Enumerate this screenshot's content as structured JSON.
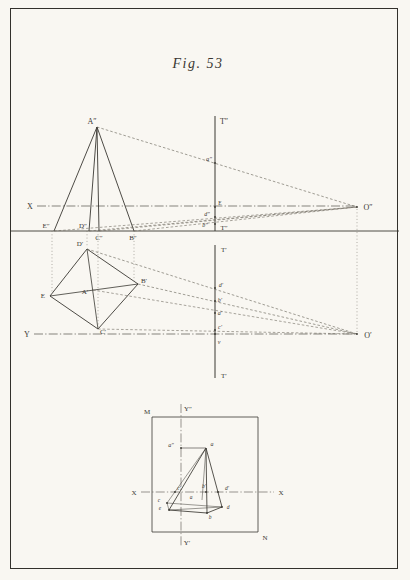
{
  "title": "Fig. 53",
  "colors": {
    "paper": "#f9f7f2",
    "ink": "#3a3832",
    "border": "#33312c",
    "dashed_ray": "#6e6a60",
    "dotted_projector": "#7d7970",
    "axis_dashdot": "#55524a"
  },
  "diagram": {
    "labels": [
      {
        "t": "A″",
        "x": 92,
        "y": 124,
        "fs": 8
      },
      {
        "t": "X",
        "x": 30,
        "y": 209,
        "fs": 8
      },
      {
        "t": "E″",
        "x": 46,
        "y": 228,
        "fs": 7
      },
      {
        "t": "D″",
        "x": 83,
        "y": 228,
        "fs": 7
      },
      {
        "t": "C″",
        "x": 99,
        "y": 240,
        "fs": 7
      },
      {
        "t": "B″",
        "x": 133,
        "y": 240,
        "fs": 7
      },
      {
        "t": "T″",
        "x": 224,
        "y": 124,
        "fs": 8
      },
      {
        "t": "a″",
        "x": 209,
        "y": 161,
        "fs": 6.5,
        "it": true
      },
      {
        "t": "E",
        "x": 220,
        "y": 205,
        "fs": 5.5
      },
      {
        "t": "d″",
        "x": 207,
        "y": 216,
        "fs": 6,
        "it": true
      },
      {
        "t": "b″",
        "x": 205,
        "y": 227,
        "fs": 6,
        "it": true
      },
      {
        "t": "T″",
        "x": 224,
        "y": 230,
        "fs": 7
      },
      {
        "t": "O″",
        "x": 368,
        "y": 210,
        "fs": 8
      },
      {
        "t": "T′",
        "x": 224,
        "y": 252,
        "fs": 7
      },
      {
        "t": "D′",
        "x": 80,
        "y": 246,
        "fs": 7
      },
      {
        "t": "E",
        "x": 43,
        "y": 298,
        "fs": 7
      },
      {
        "t": "A′",
        "x": 85,
        "y": 294,
        "fs": 7
      },
      {
        "t": "B′",
        "x": 144,
        "y": 283,
        "fs": 7
      },
      {
        "t": "C′",
        "x": 103,
        "y": 334,
        "fs": 7
      },
      {
        "t": "Y",
        "x": 27,
        "y": 337,
        "fs": 8
      },
      {
        "t": "d′",
        "x": 221,
        "y": 287,
        "fs": 6,
        "it": true
      },
      {
        "t": "b′",
        "x": 220,
        "y": 302,
        "fs": 6,
        "it": true
      },
      {
        "t": "a′",
        "x": 220,
        "y": 315,
        "fs": 6,
        "it": true
      },
      {
        "t": "c′",
        "x": 220,
        "y": 329,
        "fs": 6,
        "it": true
      },
      {
        "t": "v",
        "x": 219,
        "y": 344,
        "fs": 6,
        "it": true
      },
      {
        "t": "T′",
        "x": 224,
        "y": 378,
        "fs": 7
      },
      {
        "t": "O′",
        "x": 368,
        "y": 338,
        "fs": 8
      },
      {
        "t": "M",
        "x": 147,
        "y": 414,
        "fs": 7
      },
      {
        "t": "Y″",
        "x": 188,
        "y": 411,
        "fs": 7
      },
      {
        "t": "X",
        "x": 134,
        "y": 495,
        "fs": 7
      },
      {
        "t": "X",
        "x": 281,
        "y": 495,
        "fs": 7
      },
      {
        "t": "a″",
        "x": 171,
        "y": 447,
        "fs": 6,
        "it": true
      },
      {
        "t": "a",
        "x": 212,
        "y": 446,
        "fs": 6,
        "it": true
      },
      {
        "t": "c′",
        "x": 179,
        "y": 490,
        "fs": 5.5,
        "it": true
      },
      {
        "t": "b′",
        "x": 204,
        "y": 488,
        "fs": 5.5,
        "it": true
      },
      {
        "t": "d′",
        "x": 227,
        "y": 490,
        "fs": 5.5,
        "it": true
      },
      {
        "t": "a",
        "x": 191,
        "y": 499,
        "fs": 5.5,
        "it": true
      },
      {
        "t": "c",
        "x": 159,
        "y": 502,
        "fs": 5.5,
        "it": true
      },
      {
        "t": "e",
        "x": 160,
        "y": 510,
        "fs": 5.5,
        "it": true
      },
      {
        "t": "b",
        "x": 210,
        "y": 519,
        "fs": 5.5,
        "it": true
      },
      {
        "t": "d",
        "x": 228,
        "y": 509,
        "fs": 5.5,
        "it": true
      },
      {
        "t": "N",
        "x": 265,
        "y": 540,
        "fs": 7
      },
      {
        "t": "Y′",
        "x": 187,
        "y": 545,
        "fs": 7
      }
    ],
    "lines": [
      {
        "s": "so",
        "w": 0.9,
        "p": [
          11,
          231,
          399,
          231
        ]
      },
      {
        "s": "so",
        "w": 1.0,
        "p": [
          215,
          116,
          215,
          231
        ]
      },
      {
        "s": "so",
        "w": 1.0,
        "p": [
          215,
          245,
          215,
          378
        ]
      },
      {
        "s": "dd",
        "w": 0.7,
        "p": [
          37,
          206,
          357,
          206
        ]
      },
      {
        "s": "dd",
        "w": 0.7,
        "p": [
          34,
          334,
          357,
          334
        ]
      },
      {
        "s": "so",
        "w": 0.9,
        "p": [
          97,
          127,
          54,
          231
        ]
      },
      {
        "s": "so",
        "w": 0.9,
        "p": [
          97,
          127,
          89,
          231
        ]
      },
      {
        "s": "so",
        "w": 0.9,
        "p": [
          97,
          127,
          99,
          231
        ]
      },
      {
        "s": "so",
        "w": 0.9,
        "p": [
          97,
          127,
          134,
          231
        ]
      },
      {
        "s": "da",
        "w": 0.65,
        "p": [
          97,
          127,
          357,
          207
        ]
      },
      {
        "s": "da",
        "w": 0.6,
        "p": [
          54,
          231,
          357,
          207
        ]
      },
      {
        "s": "da",
        "w": 0.6,
        "p": [
          89,
          231,
          357,
          207
        ]
      },
      {
        "s": "da",
        "w": 0.6,
        "p": [
          99,
          231,
          357,
          207
        ]
      },
      {
        "s": "da",
        "w": 0.6,
        "p": [
          134,
          231,
          357,
          207
        ]
      },
      {
        "s": "so",
        "w": 0.9,
        "p": [
          87,
          249,
          50,
          296
        ]
      },
      {
        "s": "so",
        "w": 0.9,
        "p": [
          50,
          296,
          98,
          329
        ]
      },
      {
        "s": "so",
        "w": 0.9,
        "p": [
          98,
          329,
          138,
          284
        ]
      },
      {
        "s": "so",
        "w": 0.9,
        "p": [
          138,
          284,
          87,
          249
        ]
      },
      {
        "s": "so",
        "w": 0.8,
        "p": [
          50,
          296,
          138,
          284
        ]
      },
      {
        "s": "so",
        "w": 0.8,
        "p": [
          87,
          249,
          98,
          329
        ]
      },
      {
        "s": "da",
        "w": 0.65,
        "p": [
          87,
          249,
          357,
          334
        ]
      },
      {
        "s": "da",
        "w": 0.65,
        "p": [
          138,
          284,
          357,
          334
        ]
      },
      {
        "s": "da",
        "w": 0.6,
        "p": [
          93,
          290,
          357,
          334
        ]
      },
      {
        "s": "da",
        "w": 0.6,
        "p": [
          98,
          329,
          357,
          334
        ]
      },
      {
        "s": "do",
        "w": 0.6,
        "p": [
          52,
          231,
          52,
          293
        ]
      },
      {
        "s": "do",
        "w": 0.6,
        "p": [
          87,
          231,
          87,
          247
        ]
      },
      {
        "s": "do",
        "w": 0.6,
        "p": [
          98,
          231,
          98,
          327
        ]
      },
      {
        "s": "do",
        "w": 0.6,
        "p": [
          134,
          231,
          134,
          281
        ]
      },
      {
        "s": "do",
        "w": 0.6,
        "p": [
          357,
          209,
          357,
          332
        ]
      },
      {
        "s": "so",
        "w": 0.8,
        "p": [
          152,
          417,
          258,
          417
        ]
      },
      {
        "s": "so",
        "w": 0.8,
        "p": [
          258,
          417,
          258,
          532
        ]
      },
      {
        "s": "so",
        "w": 0.8,
        "p": [
          258,
          532,
          152,
          532
        ]
      },
      {
        "s": "so",
        "w": 0.8,
        "p": [
          152,
          532,
          152,
          417
        ]
      },
      {
        "s": "dd",
        "w": 0.6,
        "p": [
          181,
          404,
          181,
          546
        ]
      },
      {
        "s": "dd",
        "w": 0.6,
        "p": [
          141,
          492,
          274,
          492
        ]
      },
      {
        "s": "so",
        "w": 0.6,
        "p": [
          181,
          448,
          206,
          448
        ]
      },
      {
        "s": "so",
        "w": 0.85,
        "p": [
          206,
          448,
          169,
          510
        ]
      },
      {
        "s": "so",
        "w": 0.85,
        "p": [
          206,
          448,
          207,
          513
        ]
      },
      {
        "s": "so",
        "w": 0.85,
        "p": [
          206,
          448,
          222,
          507
        ]
      },
      {
        "s": "so",
        "w": 0.5,
        "p": [
          206,
          448,
          167,
          503
        ]
      },
      {
        "s": "so",
        "w": 0.5,
        "p": [
          206,
          448,
          202,
          500
        ]
      },
      {
        "s": "so",
        "w": 0.85,
        "p": [
          169,
          510,
          207,
          513
        ]
      },
      {
        "s": "so",
        "w": 0.85,
        "p": [
          207,
          513,
          222,
          507
        ]
      },
      {
        "s": "so",
        "w": 0.5,
        "p": [
          167,
          503,
          222,
          507
        ]
      },
      {
        "s": "so",
        "w": 0.5,
        "p": [
          167,
          503,
          169,
          510
        ]
      },
      {
        "s": "so",
        "w": 0.5,
        "p": [
          169,
          510,
          222,
          507
        ]
      }
    ],
    "dots": [
      [
        215,
        163
      ],
      [
        215,
        207
      ],
      [
        215,
        217
      ],
      [
        215,
        224
      ],
      [
        357,
        207
      ],
      [
        215,
        288
      ],
      [
        215,
        301
      ],
      [
        215,
        313
      ],
      [
        215,
        330
      ],
      [
        215,
        334
      ],
      [
        357,
        334
      ],
      [
        175,
        492
      ],
      [
        206,
        492
      ],
      [
        218,
        492
      ],
      [
        181,
        448
      ],
      [
        167,
        503
      ],
      [
        169,
        510
      ],
      [
        207,
        513
      ],
      [
        222,
        507
      ]
    ]
  }
}
